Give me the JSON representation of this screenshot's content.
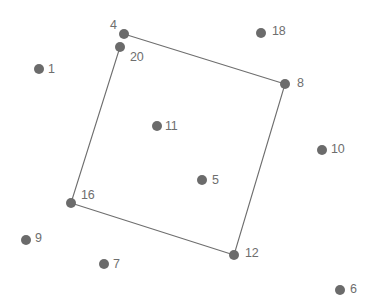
{
  "figure": {
    "title": "",
    "background_color": "#ffffff",
    "width": 367,
    "height": 303
  },
  "style": {
    "point_color": "#6b6b6b",
    "point_radius": 5,
    "edge_color": "#6e6e6e",
    "edge_width": 1.1,
    "label_color": "#6e6e6e",
    "label_font_size": 12.5
  },
  "chart_data": {
    "type": "scatter",
    "title": "",
    "xlabel": "",
    "ylabel": "",
    "grid": false,
    "legend": null,
    "axes_visible": false,
    "xlim": [
      0,
      367
    ],
    "ylim": [
      0,
      303
    ],
    "points": [
      {
        "label": "4",
        "x": 124,
        "y": 34,
        "label_x": 110,
        "label_y": 26,
        "in_polygon": true
      },
      {
        "label": "20",
        "x": 120,
        "y": 47,
        "label_x": 130,
        "label_y": 58,
        "in_polygon": true
      },
      {
        "label": "18",
        "x": 261,
        "y": 33,
        "label_x": 272,
        "label_y": 32,
        "in_polygon": false
      },
      {
        "label": "1",
        "x": 39,
        "y": 69,
        "label_x": 48,
        "label_y": 70,
        "in_polygon": false
      },
      {
        "label": "8",
        "x": 285,
        "y": 84,
        "label_x": 297,
        "label_y": 84,
        "in_polygon": true
      },
      {
        "label": "11",
        "x": 157,
        "y": 126,
        "label_x": 165,
        "label_y": 127,
        "in_polygon": false
      },
      {
        "label": "10",
        "x": 322,
        "y": 150,
        "label_x": 331,
        "label_y": 150,
        "in_polygon": false
      },
      {
        "label": "5",
        "x": 202,
        "y": 180,
        "label_x": 212,
        "label_y": 181,
        "in_polygon": false
      },
      {
        "label": "16",
        "x": 71,
        "y": 203,
        "label_x": 81,
        "label_y": 196,
        "in_polygon": true
      },
      {
        "label": "9",
        "x": 26,
        "y": 240,
        "label_x": 35,
        "label_y": 239,
        "in_polygon": false
      },
      {
        "label": "12",
        "x": 234,
        "y": 255,
        "label_x": 245,
        "label_y": 254,
        "in_polygon": true
      },
      {
        "label": "7",
        "x": 104,
        "y": 264,
        "label_x": 113,
        "label_y": 265,
        "in_polygon": false
      },
      {
        "label": "6",
        "x": 340,
        "y": 290,
        "label_x": 350,
        "label_y": 290,
        "in_polygon": false
      }
    ],
    "polygon": {
      "closed": true,
      "vertex_labels": [
        "4",
        "8",
        "12",
        "16",
        "20"
      ],
      "vertices": [
        {
          "label": "4",
          "x": 124,
          "y": 34
        },
        {
          "label": "8",
          "x": 285,
          "y": 84
        },
        {
          "label": "12",
          "x": 234,
          "y": 255
        },
        {
          "label": "16",
          "x": 71,
          "y": 203
        },
        {
          "label": "20",
          "x": 120,
          "y": 47
        }
      ],
      "edges": [
        {
          "from": "4",
          "to": "8"
        },
        {
          "from": "8",
          "to": "12"
        },
        {
          "from": "12",
          "to": "16"
        },
        {
          "from": "16",
          "to": "20"
        }
      ]
    }
  }
}
